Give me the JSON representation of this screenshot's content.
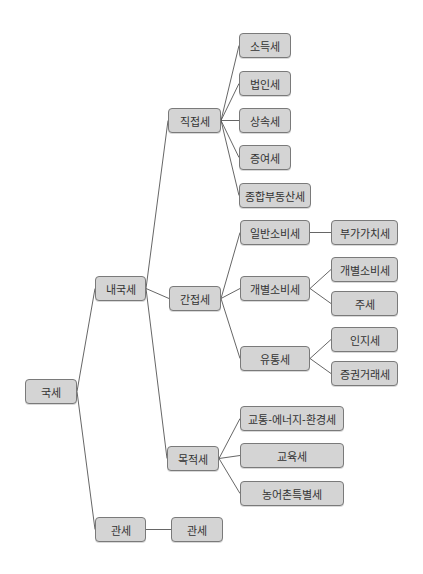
{
  "diagram": {
    "root": "국세",
    "nodes": {
      "n_gukse": {
        "label": "국세",
        "x": 25,
        "y": 379,
        "w": 52,
        "h": 25
      },
      "n_naeguk": {
        "label": "내국세",
        "x": 95,
        "y": 276,
        "w": 51,
        "h": 25
      },
      "n_gwanse1": {
        "label": "관세",
        "x": 95,
        "y": 517,
        "w": 51,
        "h": 25
      },
      "n_gwanse2": {
        "label": "관세",
        "x": 171,
        "y": 517,
        "w": 52,
        "h": 25
      },
      "n_jikjeop": {
        "label": "직접세",
        "x": 168,
        "y": 108,
        "w": 53,
        "h": 25
      },
      "n_ganjeop": {
        "label": "간접세",
        "x": 169,
        "y": 286,
        "w": 52,
        "h": 25
      },
      "n_mokjeok": {
        "label": "목적세",
        "x": 167,
        "y": 446,
        "w": 52,
        "h": 25
      },
      "n_sodeuk": {
        "label": "소득세",
        "x": 239,
        "y": 33,
        "w": 52,
        "h": 25
      },
      "n_beobin": {
        "label": "법인세",
        "x": 239,
        "y": 71,
        "w": 52,
        "h": 25
      },
      "n_sangsok": {
        "label": "상속세",
        "x": 239,
        "y": 108,
        "w": 52,
        "h": 25
      },
      "n_jeungyeo": {
        "label": "증여세",
        "x": 239,
        "y": 145,
        "w": 52,
        "h": 25
      },
      "n_jonghap": {
        "label": "종합부동산세",
        "x": 239,
        "y": 183,
        "w": 72,
        "h": 25
      },
      "n_ilban": {
        "label": "일반소비세",
        "x": 240,
        "y": 220,
        "w": 70,
        "h": 25
      },
      "n_gaebyeol1": {
        "label": "개별소비세",
        "x": 240,
        "y": 276,
        "w": 70,
        "h": 25
      },
      "n_yutong": {
        "label": "유통세",
        "x": 240,
        "y": 346,
        "w": 70,
        "h": 25
      },
      "n_bugagachi": {
        "label": "부가가치세",
        "x": 331,
        "y": 220,
        "w": 67,
        "h": 25
      },
      "n_gaebyeol2": {
        "label": "개별소비세",
        "x": 331,
        "y": 257,
        "w": 67,
        "h": 25
      },
      "n_juse": {
        "label": "주세",
        "x": 331,
        "y": 291,
        "w": 67,
        "h": 25
      },
      "n_inji": {
        "label": "인지세",
        "x": 331,
        "y": 327,
        "w": 67,
        "h": 25
      },
      "n_jeunggwon": {
        "label": "증권거래세",
        "x": 331,
        "y": 361,
        "w": 67,
        "h": 25
      },
      "n_gyotong": {
        "label": "교통-에너지-환경세",
        "x": 240,
        "y": 406,
        "w": 104,
        "h": 25
      },
      "n_gyoyuk": {
        "label": "교육세",
        "x": 240,
        "y": 443,
        "w": 104,
        "h": 25
      },
      "n_nongeochon": {
        "label": "농어촌특별세",
        "x": 240,
        "y": 481,
        "w": 104,
        "h": 25
      }
    },
    "edges": [
      [
        "n_gukse",
        "n_naeguk"
      ],
      [
        "n_gukse",
        "n_gwanse1"
      ],
      [
        "n_gwanse1",
        "n_gwanse2"
      ],
      [
        "n_naeguk",
        "n_jikjeop"
      ],
      [
        "n_naeguk",
        "n_ganjeop"
      ],
      [
        "n_naeguk",
        "n_mokjeok"
      ],
      [
        "n_jikjeop",
        "n_sodeuk"
      ],
      [
        "n_jikjeop",
        "n_beobin"
      ],
      [
        "n_jikjeop",
        "n_sangsok"
      ],
      [
        "n_jikjeop",
        "n_jeungyeo"
      ],
      [
        "n_jikjeop",
        "n_jonghap"
      ],
      [
        "n_ganjeop",
        "n_ilban"
      ],
      [
        "n_ganjeop",
        "n_gaebyeol1"
      ],
      [
        "n_ganjeop",
        "n_yutong"
      ],
      [
        "n_ilban",
        "n_bugagachi"
      ],
      [
        "n_gaebyeol1",
        "n_gaebyeol2"
      ],
      [
        "n_gaebyeol1",
        "n_juse"
      ],
      [
        "n_yutong",
        "n_inji"
      ],
      [
        "n_yutong",
        "n_jeunggwon"
      ],
      [
        "n_mokjeok",
        "n_gyotong"
      ],
      [
        "n_mokjeok",
        "n_gyoyuk"
      ],
      [
        "n_mokjeok",
        "n_nongeochon"
      ]
    ],
    "colors": {
      "node_fill": "#d4d4d4",
      "node_border": "#7a7a7a",
      "line": "#555555",
      "text": "#333333"
    }
  }
}
